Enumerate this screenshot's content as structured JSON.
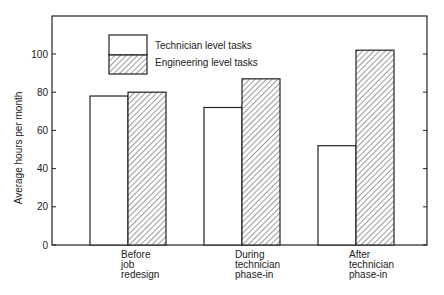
{
  "chart_data": {
    "type": "bar",
    "title": "",
    "xlabel": "",
    "ylabel": "Average hours per month",
    "ylim": [
      0,
      120
    ],
    "yticks": [
      0,
      20,
      40,
      60,
      80,
      100
    ],
    "grid": false,
    "legend_position": "upper-left-inside",
    "categories": [
      [
        "Before",
        "job",
        "redesign"
      ],
      [
        "During",
        "technician",
        "phase-in"
      ],
      [
        "After",
        "technician",
        "phase-in"
      ]
    ],
    "category_labels": [
      "Before job redesign",
      "During technician phase-in",
      "After technician phase-in"
    ],
    "series": [
      {
        "name": "Technician level tasks",
        "pattern": "plain",
        "values": [
          78,
          72,
          52
        ]
      },
      {
        "name": "Engineering level tasks",
        "pattern": "hatched",
        "values": [
          80,
          87,
          102
        ]
      }
    ]
  },
  "colors": {
    "stroke": "#222222",
    "fill": "#ffffff",
    "hatch": "#555555"
  }
}
